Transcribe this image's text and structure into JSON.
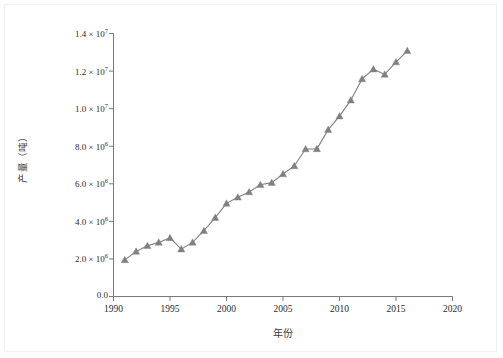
{
  "chart_data": {
    "type": "line",
    "title": "",
    "xlabel": "年份",
    "ylabel": "产量（吨）",
    "xlim": [
      1990,
      2020
    ],
    "ylim": [
      0,
      14000000
    ],
    "grid": false,
    "legend": null,
    "marker": "triangle",
    "series_color": "#808080",
    "xticks": [
      1990,
      1995,
      2000,
      2005,
      2010,
      2015,
      2020
    ],
    "xtick_labels": [
      "1990",
      "1995",
      "2000",
      "2005",
      "2010",
      "2015",
      "2020"
    ],
    "yticks": [
      0,
      2000000,
      4000000,
      6000000,
      8000000,
      10000000,
      12000000,
      14000000
    ],
    "ytick_labels": [
      "0.0",
      "2.0 × 10",
      "4.0 × 10",
      "6.0 × 10",
      "8.0 × 10",
      "1.0 × 10",
      "1.2 × 10",
      "1.4 × 10"
    ],
    "ytick_exponents": [
      "",
      "6",
      "6",
      "6",
      "6",
      "7",
      "7",
      "7"
    ],
    "x": [
      1991,
      1992,
      1993,
      1994,
      1995,
      1996,
      1997,
      1998,
      1999,
      2000,
      2001,
      2002,
      2003,
      2004,
      2005,
      2006,
      2007,
      2008,
      2009,
      2010,
      2011,
      2012,
      2013,
      2014,
      2015,
      2016
    ],
    "values": [
      1950000,
      2400000,
      2700000,
      2880000,
      3120000,
      2520000,
      2880000,
      3500000,
      4200000,
      4960000,
      5280000,
      5560000,
      5950000,
      6060000,
      6520000,
      6950000,
      7850000,
      7860000,
      8880000,
      9600000,
      10450000,
      11580000,
      12100000,
      11820000,
      12480000,
      13080000
    ],
    "series": [
      {
        "name": "产量",
        "values": [
          1950000,
          2400000,
          2700000,
          2880000,
          3120000,
          2520000,
          2880000,
          3500000,
          4200000,
          4960000,
          5280000,
          5560000,
          5950000,
          6060000,
          6520000,
          6950000,
          7850000,
          7860000,
          8880000,
          9600000,
          10450000,
          11580000,
          12100000,
          11820000,
          12480000,
          13080000
        ]
      }
    ]
  },
  "axis": {
    "ylabel_text": "产量（吨）",
    "xlabel_text": "年份"
  }
}
